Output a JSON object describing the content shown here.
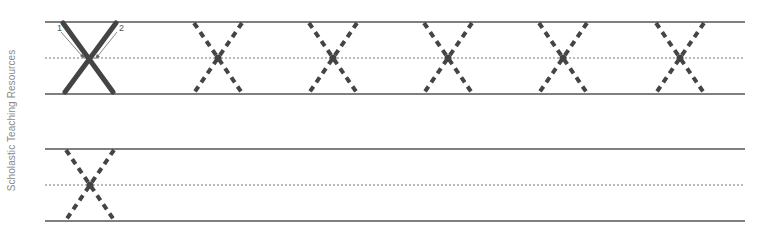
{
  "worksheet": {
    "credit": "Scholastic Teaching Resources",
    "letter": "X",
    "stroke_order": [
      "1",
      "2"
    ],
    "colors": {
      "rule_line": "#555555",
      "midline": "#777777",
      "model_letter": "#444444",
      "trace_letter": "#444444",
      "arrow": "#666666",
      "credit_text": "#8a8a8a"
    },
    "rows": [
      {
        "top_y": 22,
        "mid_y": 58,
        "bottom_y": 94,
        "model": {
          "center_x": 90
        },
        "trace_centers_x": [
          218,
          333,
          448,
          563,
          680
        ]
      },
      {
        "top_y": 149,
        "mid_y": 185,
        "bottom_y": 221,
        "trace_centers_x": [
          90
        ]
      }
    ]
  }
}
